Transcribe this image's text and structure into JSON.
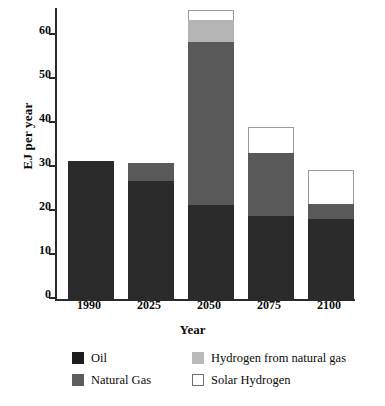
{
  "chart_data": {
    "type": "bar",
    "subtype": "stacked",
    "title": "",
    "xlabel": "Year",
    "ylabel": "EJ per year",
    "categories": [
      "1990",
      "2025",
      "2050",
      "2075",
      "2100"
    ],
    "ylim": [
      0,
      66
    ],
    "yticks": [
      0,
      10,
      20,
      30,
      40,
      50,
      60
    ],
    "ytick_labels": [
      "0",
      "10",
      "20",
      "30",
      "40",
      "50",
      "60"
    ],
    "grid": false,
    "legend_position": "below-axes",
    "series": [
      {
        "name": "Oil",
        "color": "#2b2b2b",
        "values": [
          31.4,
          26.8,
          21.4,
          18.9,
          18.2
        ]
      },
      {
        "name": "Natural Gas",
        "color": "#595959",
        "values": [
          0.0,
          4.2,
          37.0,
          14.3,
          3.4
        ]
      },
      {
        "name": "Hydrogen from natural gas",
        "color": "#b4b4b4",
        "values": [
          0.0,
          0.0,
          5.0,
          0.0,
          0.0
        ]
      },
      {
        "name": "Solar Hydrogen",
        "color": "#ffffff",
        "values": [
          0.0,
          0.0,
          2.3,
          5.9,
          7.7
        ]
      }
    ],
    "totals": [
      31.4,
      31.0,
      65.7,
      39.1,
      29.3
    ]
  },
  "legend": {
    "entries": [
      {
        "label": "Oil",
        "swatch": "oil"
      },
      {
        "label": "Hydrogen from natural gas",
        "swatch": "h2gas"
      },
      {
        "label": "Natural Gas",
        "swatch": "gas"
      },
      {
        "label": "Solar Hydrogen",
        "swatch": "solar"
      }
    ]
  }
}
